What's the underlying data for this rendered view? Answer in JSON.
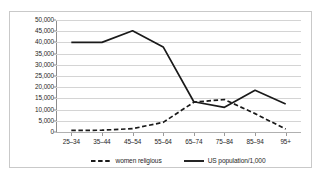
{
  "chart_data": {
    "type": "line",
    "title": "",
    "xlabel": "",
    "ylabel": "",
    "ylim": [
      0,
      50000
    ],
    "grid": true,
    "legend_position": "bottom",
    "categories": [
      "25–34",
      "35–44",
      "45–54",
      "55–64",
      "65–74",
      "75–84",
      "85–94",
      "95+"
    ],
    "ytick_labels": [
      "50,000",
      "45,000",
      "40,000",
      "35,000",
      "30,000",
      "25,000",
      "20,000",
      "15,000",
      "10,000",
      "5,000",
      "0"
    ],
    "ytick_values": [
      50000,
      45000,
      40000,
      35000,
      30000,
      25000,
      20000,
      15000,
      10000,
      5000,
      0
    ],
    "series": [
      {
        "name": "women religious",
        "style": "dashed",
        "color": "#1a1a1a",
        "values": [
          700,
          800,
          1500,
          4300,
          13300,
          14500,
          8200,
          1300
        ]
      },
      {
        "name": "US population/1,000",
        "style": "solid",
        "color": "#1a1a1a",
        "values": [
          40000,
          40000,
          45200,
          38000,
          13500,
          11000,
          18600,
          12500
        ]
      }
    ]
  },
  "legend": {
    "items": [
      {
        "label": "women religious",
        "style": "dashed"
      },
      {
        "label": "US population/1,000",
        "style": "solid"
      }
    ]
  }
}
